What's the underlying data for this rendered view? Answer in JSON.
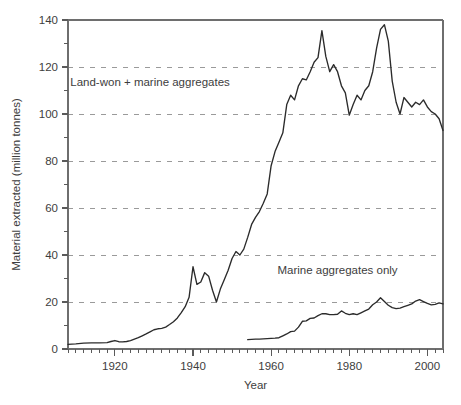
{
  "chart_data": {
    "type": "line",
    "title": "",
    "xlabel": "Year",
    "ylabel": "Material extracted (million tonnes)",
    "xlim": [
      1908,
      2004
    ],
    "ylim": [
      0,
      140
    ],
    "grid": "horizontal-dashed",
    "legend_position": "inline-annotations",
    "y_ticks_major": [
      0,
      20,
      40,
      60,
      80,
      100,
      120,
      140
    ],
    "y_ticks_major_labels": [
      "0",
      "20",
      "40",
      "60",
      "80",
      "100",
      "120",
      "140"
    ],
    "y_ticks_minor": [
      10,
      30,
      50,
      70,
      90,
      110,
      130
    ],
    "x_ticks_major": [
      1920,
      1940,
      1960,
      1980,
      2000
    ],
    "x_ticks_major_labels": [
      "1920",
      "1940",
      "1960",
      "1980",
      "2000"
    ],
    "x_tick_minor_step": 2,
    "gridlines_at": [
      20,
      40,
      60,
      80,
      100,
      120
    ],
    "series": [
      {
        "name": "Land-won + marine aggregates",
        "annotation_label": "Land-won + marine aggregates",
        "color": "#2b2b2b",
        "x": [
          1908,
          1910,
          1912,
          1914,
          1916,
          1918,
          1919,
          1920,
          1921,
          1922,
          1923,
          1924,
          1925,
          1926,
          1927,
          1928,
          1929,
          1930,
          1931,
          1932,
          1933,
          1934,
          1935,
          1936,
          1937,
          1938,
          1939,
          1940,
          1941,
          1942,
          1943,
          1944,
          1945,
          1946,
          1947,
          1948,
          1949,
          1950,
          1951,
          1952,
          1953,
          1954,
          1955,
          1956,
          1957,
          1958,
          1959,
          1960,
          1961,
          1962,
          1963,
          1964,
          1965,
          1966,
          1967,
          1968,
          1969,
          1970,
          1971,
          1972,
          1973,
          1974,
          1975,
          1976,
          1977,
          1978,
          1979,
          1980,
          1981,
          1982,
          1983,
          1984,
          1985,
          1986,
          1987,
          1988,
          1989,
          1990,
          1991,
          1992,
          1993,
          1994,
          1995,
          1996,
          1997,
          1998,
          1999,
          2000,
          2001,
          2002,
          2003,
          2004
        ],
        "y": [
          2.0,
          2.2,
          2.5,
          2.6,
          2.6,
          2.7,
          3.2,
          3.6,
          3.1,
          3.0,
          3.2,
          3.6,
          4.2,
          4.8,
          5.6,
          6.4,
          7.3,
          8.2,
          8.6,
          8.8,
          9.3,
          10.4,
          11.6,
          13.2,
          15.5,
          18.0,
          22.0,
          35.0,
          27.5,
          28.5,
          32.5,
          31.0,
          25.0,
          20.0,
          25.5,
          29.5,
          33.5,
          38.5,
          41.5,
          40.0,
          42.5,
          47.5,
          53.0,
          56.0,
          58.5,
          62.0,
          66.0,
          78.0,
          84.0,
          88.0,
          92.0,
          104.0,
          108.0,
          106.0,
          112.0,
          115.0,
          114.5,
          118.0,
          122.0,
          124.0,
          135.5,
          124.5,
          118.0,
          121.0,
          118.0,
          112.0,
          109.0,
          99.5,
          104.0,
          108.0,
          106.0,
          110.0,
          112.0,
          118.0,
          128.0,
          136.0,
          138.0,
          131.0,
          114.0,
          105.0,
          100.0,
          107.0,
          105.0,
          103.0,
          105.0,
          104.0,
          106.0,
          103.0,
          101.0,
          100.0,
          98.0,
          93.0
        ]
      },
      {
        "name": "Marine aggregates only",
        "annotation_label": "Marine aggregates only",
        "color": "#2b2b2b",
        "x": [
          1954,
          1955,
          1956,
          1957,
          1958,
          1959,
          1960,
          1961,
          1962,
          1963,
          1964,
          1965,
          1966,
          1967,
          1968,
          1969,
          1970,
          1971,
          1972,
          1973,
          1974,
          1975,
          1976,
          1977,
          1978,
          1979,
          1980,
          1981,
          1982,
          1983,
          1984,
          1985,
          1986,
          1987,
          1988,
          1989,
          1990,
          1991,
          1992,
          1993,
          1994,
          1995,
          1996,
          1997,
          1998,
          1999,
          2000,
          2001,
          2002,
          2003,
          2004
        ],
        "y": [
          4.0,
          4.1,
          4.2,
          4.2,
          4.3,
          4.4,
          4.5,
          4.6,
          4.8,
          5.6,
          6.4,
          7.4,
          7.6,
          9.3,
          11.8,
          12.0,
          13.0,
          13.2,
          14.2,
          15.0,
          15.0,
          14.6,
          14.6,
          14.8,
          16.2,
          15.2,
          14.6,
          15.0,
          14.6,
          15.4,
          16.2,
          17.0,
          18.8,
          20.0,
          21.8,
          20.2,
          18.6,
          17.6,
          17.2,
          17.4,
          18.0,
          18.6,
          19.2,
          20.4,
          21.0,
          20.2,
          19.4,
          18.8,
          19.0,
          19.6,
          19.2
        ]
      }
    ],
    "annotations": [
      {
        "text": "Land-won + marine aggregates",
        "x_year": 1929,
        "y_value": 112
      },
      {
        "text": "Marine aggregates only",
        "x_year": 1977,
        "y_value": 32
      }
    ]
  }
}
